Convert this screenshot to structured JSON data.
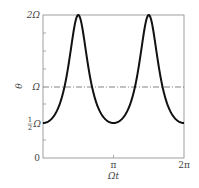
{
  "chart_data": {
    "type": "line",
    "title": "",
    "xlabel": "Ωt",
    "ylabel": "θ̇",
    "xlim": [
      0,
      6.2832
    ],
    "ylim": [
      0,
      2
    ],
    "x_ticks": [
      {
        "value": 0,
        "label": ""
      },
      {
        "value": 3.1416,
        "label": "π"
      },
      {
        "value": 6.2832,
        "label": "2π"
      }
    ],
    "y_ticks": [
      {
        "value": 0,
        "label": "0"
      },
      {
        "value": 0.5,
        "label": "½Ω"
      },
      {
        "value": 1,
        "label": "Ω"
      },
      {
        "value": 2,
        "label": "2Ω"
      }
    ],
    "series": [
      {
        "name": "θ̇(Ωt)",
        "style": "solid",
        "formula": "Ω / (2cos²(Ωt) + 0.5sin²(Ωt))",
        "x": [
          0,
          0.785,
          1.571,
          2.356,
          3.1416,
          3.927,
          4.712,
          5.498,
          6.2832
        ],
        "values": [
          0.5,
          0.8,
          2.0,
          0.8,
          0.5,
          0.8,
          2.0,
          0.8,
          0.5
        ]
      },
      {
        "name": "Ω reference",
        "style": "dash-dot",
        "x": [
          0,
          6.2832
        ],
        "values": [
          1,
          1
        ]
      }
    ],
    "grid": false,
    "legend": "none",
    "frame": "box"
  },
  "labels": {
    "y_axis": "θ",
    "x_axis": "Ωt",
    "tick_2omega": "2Ω",
    "tick_omega": "Ω",
    "tick_half_num": "1",
    "tick_half_den": "2",
    "tick_half_omega": "Ω",
    "tick_zero": "0",
    "tick_pi": "π",
    "tick_2pi": "2π"
  }
}
